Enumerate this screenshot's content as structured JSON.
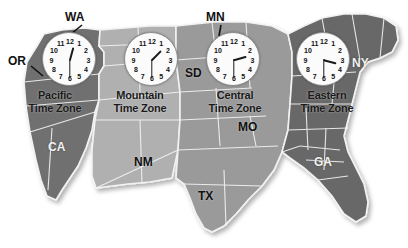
{
  "figure": {
    "background_color": "#ffffff"
  },
  "zones": [
    {
      "id": "pacific",
      "name": "Pacific",
      "line2": "Time Zone",
      "fill": "#6f6f6f",
      "clock_time": "12:30",
      "hour": 12,
      "minute": 30
    },
    {
      "id": "mountain",
      "name": "Mountain",
      "line2": "Time Zone",
      "fill": "#b0b0b0",
      "clock_time": "1:30",
      "hour": 1,
      "minute": 30
    },
    {
      "id": "central",
      "name": "Central",
      "line2": "Time Zone",
      "fill": "#9a9a9a",
      "clock_time": "2:30",
      "hour": 2,
      "minute": 30
    },
    {
      "id": "eastern",
      "name": "Eastern",
      "line2": "Time Zone",
      "fill": "#676767",
      "clock_time": "3:30",
      "hour": 3,
      "minute": 30
    }
  ],
  "clock_numerals": [
    "12",
    "1",
    "2",
    "3",
    "4",
    "5",
    "6",
    "7",
    "8",
    "9",
    "10",
    "11"
  ],
  "state_labels": [
    {
      "id": "wa",
      "text": "WA",
      "style": "dark"
    },
    {
      "id": "or",
      "text": "OR",
      "style": "dark"
    },
    {
      "id": "mn",
      "text": "MN",
      "style": "dark"
    },
    {
      "id": "sd",
      "text": "SD",
      "style": "dark"
    },
    {
      "id": "ny",
      "text": "NY",
      "style": "light"
    },
    {
      "id": "ca",
      "text": "CA",
      "style": "light"
    },
    {
      "id": "nm",
      "text": "NM",
      "style": "dark"
    },
    {
      "id": "tx",
      "text": "TX",
      "style": "dark"
    },
    {
      "id": "mo",
      "text": "MO",
      "style": "dark"
    },
    {
      "id": "ga",
      "text": "GA",
      "style": "light"
    }
  ],
  "colors": {
    "pacific": "#6f6f6f",
    "mountain": "#b0b0b0",
    "central": "#9a9a9a",
    "eastern": "#676767",
    "border": "#f2f2f2",
    "clock_face": "#fbfbfb",
    "clock_rim": "#8d8d8d"
  }
}
